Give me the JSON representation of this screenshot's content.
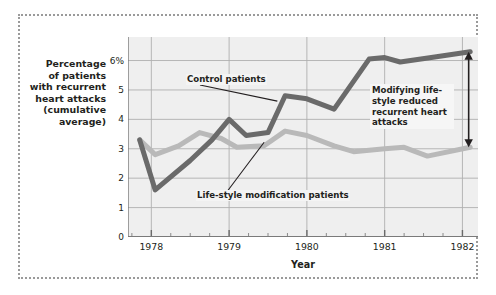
{
  "figure": {
    "y_axis_caption_lines": [
      "Percentage",
      "of patients",
      "with recurrent",
      "heart attacks",
      "(cumulative",
      "average)"
    ],
    "x_axis_title": "Year",
    "annotations": {
      "control": "Control patients",
      "lifestyle": "Life-style modification patients",
      "reduced": "Modifying life-style reduced recurrent heart attacks"
    },
    "colors": {
      "control_line": "#6a6a6a",
      "lifestyle_line": "#b9b9b9",
      "plot_background": "#efefef",
      "gridline": "#b0b0b0",
      "axis": "#7a7a7a",
      "frame_dotted": "#9a9a9a",
      "text": "#231f20"
    }
  },
  "chart_data": {
    "type": "line",
    "title": "",
    "xlabel": "Year",
    "ylabel": "Percentage of patients with recurrent heart attacks (cumulative average)",
    "xlim": [
      1977.7,
      1982.2
    ],
    "ylim": [
      0,
      6.8
    ],
    "yticks": [
      0,
      1,
      2,
      3,
      4,
      5,
      6
    ],
    "ytick_labels": [
      "0",
      "1",
      "2",
      "3",
      "4",
      "5",
      "6%"
    ],
    "xticks": [
      1978,
      1979,
      1980,
      1981,
      1982
    ],
    "xtick_labels": [
      "1978",
      "1979",
      "1980",
      "1981",
      "1982"
    ],
    "minor_xticks_per_interval": 3,
    "grid": true,
    "legend": "inline-annotations",
    "series": [
      {
        "name": "Control patients",
        "color": "#6a6a6a",
        "x": [
          1977.85,
          1978.05,
          1978.5,
          1978.78,
          1979.0,
          1979.22,
          1979.5,
          1979.72,
          1980.0,
          1980.35,
          1980.8,
          1981.0,
          1981.2,
          1981.6,
          1982.1
        ],
        "values": [
          3.3,
          1.6,
          2.6,
          3.3,
          4.0,
          3.45,
          3.55,
          4.8,
          4.7,
          4.35,
          6.05,
          6.1,
          5.95,
          6.1,
          6.3
        ]
      },
      {
        "name": "Life-style modification patients",
        "color": "#b9b9b9",
        "x": [
          1977.85,
          1978.05,
          1978.35,
          1978.62,
          1978.9,
          1979.1,
          1979.45,
          1979.72,
          1980.0,
          1980.35,
          1980.6,
          1981.0,
          1981.25,
          1981.55,
          1982.1
        ],
        "values": [
          3.3,
          2.8,
          3.1,
          3.55,
          3.35,
          3.05,
          3.1,
          3.6,
          3.45,
          3.1,
          2.9,
          3.0,
          3.05,
          2.75,
          3.05
        ]
      }
    ],
    "callout_arrow": {
      "label": "Modifying life-style reduced recurrent heart attacks",
      "x": 1982.08,
      "y_top": 6.3,
      "y_bottom": 3.05,
      "double_headed": true
    }
  }
}
